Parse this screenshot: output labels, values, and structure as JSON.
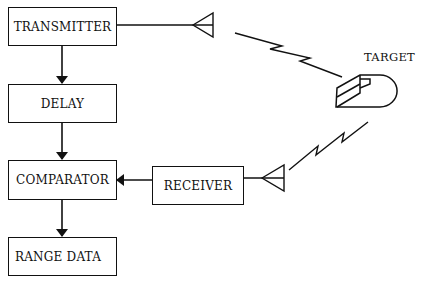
{
  "diagram": {
    "type": "block-diagram",
    "blocks": [
      {
        "id": "transmitter",
        "label": "TRANSMITTER"
      },
      {
        "id": "delay",
        "label": "DELAY"
      },
      {
        "id": "comparator",
        "label": "COMPARATOR"
      },
      {
        "id": "range_data",
        "label": "RANGE DATA"
      },
      {
        "id": "receiver",
        "label": "RECEIVER"
      }
    ],
    "target": {
      "label": "TARGET"
    },
    "connections": [
      {
        "from": "transmitter",
        "to": "delay",
        "arrow": true
      },
      {
        "from": "delay",
        "to": "comparator",
        "arrow": true
      },
      {
        "from": "comparator",
        "to": "range_data",
        "arrow": true
      },
      {
        "from": "receiver",
        "to": "comparator",
        "arrow": true
      },
      {
        "from": "transmitter",
        "to": "transmit-antenna",
        "arrow": false
      },
      {
        "from": "transmit-antenna",
        "to": "target",
        "signal": "zigzag"
      },
      {
        "from": "target",
        "to": "receive-antenna",
        "signal": "zigzag"
      },
      {
        "from": "receive-antenna",
        "to": "receiver",
        "arrow": false
      }
    ],
    "colors": {
      "ink": "#111111",
      "background": "#ffffff"
    }
  }
}
